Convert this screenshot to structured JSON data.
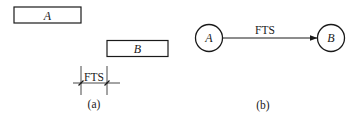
{
  "figure_a": {
    "caption": "(a)",
    "box_a": {
      "label": "A"
    },
    "box_b": {
      "label": "B"
    },
    "dimension": {
      "label": "FTS"
    }
  },
  "figure_b": {
    "caption": "(b)",
    "node_a": {
      "label": "A"
    },
    "node_b": {
      "label": "B"
    },
    "edge": {
      "label": "FTS",
      "from": "A",
      "to": "B"
    }
  },
  "colors": {
    "stroke": "#1a1a1a",
    "background": "#ffffff"
  }
}
